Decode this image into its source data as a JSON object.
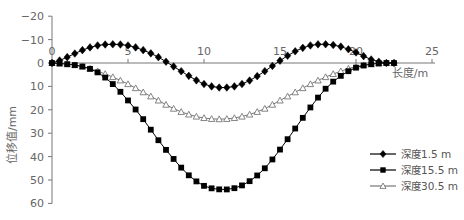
{
  "chart_data": {
    "type": "line",
    "title": "",
    "xlabel": "长度/m",
    "ylabel": "位移值/mm",
    "xlim": [
      0,
      25
    ],
    "ylim": [
      -20,
      60
    ],
    "y_inverted": true,
    "x_ticks": [
      "0",
      "5",
      "10",
      "15",
      "20",
      "25"
    ],
    "y_ticks": [
      "-20",
      "-10",
      "0",
      "10",
      "20",
      "30",
      "40",
      "50",
      "60"
    ],
    "grid": false,
    "legend_position": "lower right",
    "series": [
      {
        "name": "深度1.5 m",
        "marker": "diamond",
        "color": "#000000",
        "x": [
          0,
          1,
          2,
          3,
          4,
          5,
          6,
          7,
          8,
          9,
          10,
          11,
          12,
          13,
          14,
          15,
          16,
          17,
          18,
          19,
          20,
          21,
          22,
          22.5
        ],
        "values": [
          0,
          -2.5,
          -5.5,
          -7.5,
          -8,
          -7.5,
          -5.5,
          -2.5,
          1.5,
          5.5,
          9,
          10.5,
          10,
          7.5,
          3.5,
          -1,
          -5,
          -7.5,
          -8,
          -7,
          -4.5,
          -1.5,
          0,
          0
        ]
      },
      {
        "name": "深度15.5 m",
        "marker": "square",
        "color": "#000000",
        "x": [
          0,
          1,
          2,
          3,
          4,
          5,
          6,
          7,
          8,
          9,
          10,
          11,
          12,
          13,
          14,
          15,
          16,
          17,
          18,
          19,
          20,
          21,
          22,
          22.5
        ],
        "values": [
          0,
          0.5,
          1.5,
          4,
          9,
          16,
          24,
          33,
          41,
          48,
          52.5,
          54,
          53.5,
          50.5,
          45,
          37,
          28,
          19,
          11,
          5.5,
          2,
          0.5,
          0,
          0
        ]
      },
      {
        "name": "深度30.5 m",
        "marker": "triangle-open",
        "color": "#777777",
        "x": [
          0,
          1,
          2,
          3,
          4,
          5,
          6,
          7,
          8,
          9,
          10,
          11,
          12,
          13,
          14,
          15,
          16,
          17,
          18,
          19,
          20,
          21,
          22,
          22.5
        ],
        "values": [
          0,
          0.5,
          1.5,
          3.5,
          6,
          9,
          12.5,
          16,
          19.5,
          22,
          23.5,
          24,
          23.5,
          22,
          19.5,
          16,
          12.5,
          9,
          6,
          3.5,
          1.5,
          0.5,
          0,
          0
        ]
      }
    ]
  }
}
